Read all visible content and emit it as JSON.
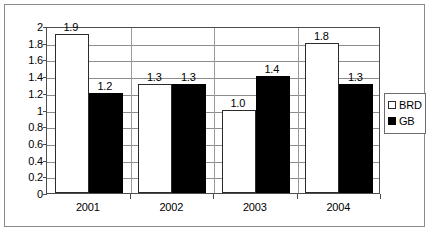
{
  "chart_data": {
    "type": "bar",
    "title": "",
    "xlabel": "",
    "ylabel": "",
    "categories": [
      "2001",
      "2002",
      "2003",
      "2004"
    ],
    "ylim": [
      0,
      2
    ],
    "ytick_step": 0.2,
    "yticks": [
      "2",
      "1.8",
      "1.6",
      "1.4",
      "1.2",
      "1",
      "0.8",
      "0.6",
      "0.4",
      "0.2",
      "0"
    ],
    "grid": true,
    "legend_position": "right",
    "series": [
      {
        "name": "BRD",
        "color": "#ffffff",
        "edge_color": "#000000",
        "values": [
          1.9,
          1.3,
          1.0,
          1.8
        ],
        "labels": [
          "1.9",
          "1.3",
          "1.0",
          "1.8"
        ]
      },
      {
        "name": "GB",
        "color": "#000000",
        "edge_color": "#000000",
        "values": [
          1.2,
          1.3,
          1.4,
          1.3
        ],
        "labels": [
          "1.2",
          "1.3",
          "1.4",
          "1.3"
        ]
      }
    ]
  },
  "legend": {
    "items": [
      {
        "label": "BRD",
        "swatch": "white-square-swatch"
      },
      {
        "label": "GB",
        "swatch": "black-square-swatch"
      }
    ]
  }
}
